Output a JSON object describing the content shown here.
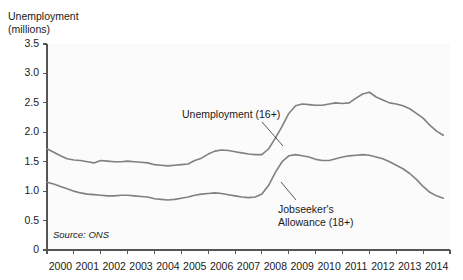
{
  "chart_data": {
    "type": "line",
    "title": "",
    "axis_title": "Unemployment\n(millions)",
    "xlabel": "",
    "ylabel": "Unemployment (millions)",
    "ylim": [
      0,
      3.5
    ],
    "xlim": [
      2000,
      2015
    ],
    "grid": false,
    "legend_position": "inline-annotations",
    "yticks": [
      "0",
      "0.5",
      "1.0",
      "1.5",
      "2.0",
      "2.5",
      "3.0",
      "3.5"
    ],
    "ytick_values": [
      0,
      0.5,
      1.0,
      1.5,
      2.0,
      2.5,
      3.0,
      3.5
    ],
    "xticks": [
      "2000",
      "2001",
      "2002",
      "2003",
      "2004",
      "2005",
      "2006",
      "2007",
      "2008",
      "2009",
      "2010",
      "2011",
      "2012",
      "2013",
      "2014"
    ],
    "xtick_values": [
      2000,
      2001,
      2002,
      2003,
      2004,
      2005,
      2006,
      2007,
      2008,
      2009,
      2010,
      2011,
      2012,
      2013,
      2014
    ],
    "source": "Source: ONS",
    "line_color": "#808080",
    "plot_background": "#fbfbfb",
    "axis_color": "#555555",
    "series": [
      {
        "name": "Unemployment (16+)",
        "label": "Unemployment (16+)",
        "x": [
          2000.0,
          2000.25,
          2000.5,
          2000.75,
          2001.0,
          2001.25,
          2001.5,
          2001.75,
          2002.0,
          2002.25,
          2002.5,
          2002.75,
          2003.0,
          2003.25,
          2003.5,
          2003.75,
          2004.0,
          2004.25,
          2004.5,
          2004.75,
          2005.0,
          2005.25,
          2005.5,
          2005.75,
          2006.0,
          2006.25,
          2006.5,
          2006.75,
          2007.0,
          2007.25,
          2007.5,
          2007.75,
          2008.0,
          2008.25,
          2008.5,
          2008.75,
          2009.0,
          2009.25,
          2009.5,
          2009.75,
          2010.0,
          2010.25,
          2010.5,
          2010.75,
          2011.0,
          2011.25,
          2011.5,
          2011.75,
          2012.0,
          2012.25,
          2012.5,
          2012.75,
          2013.0,
          2013.25,
          2013.5,
          2013.75,
          2014.0,
          2014.25,
          2014.5,
          2014.75
        ],
        "values": [
          1.72,
          1.66,
          1.6,
          1.55,
          1.53,
          1.52,
          1.5,
          1.48,
          1.52,
          1.51,
          1.5,
          1.5,
          1.51,
          1.5,
          1.49,
          1.48,
          1.45,
          1.44,
          1.43,
          1.44,
          1.45,
          1.46,
          1.52,
          1.56,
          1.63,
          1.68,
          1.7,
          1.69,
          1.67,
          1.65,
          1.63,
          1.62,
          1.62,
          1.72,
          1.9,
          2.1,
          2.32,
          2.45,
          2.48,
          2.47,
          2.46,
          2.46,
          2.48,
          2.5,
          2.49,
          2.5,
          2.58,
          2.65,
          2.68,
          2.6,
          2.55,
          2.5,
          2.48,
          2.45,
          2.4,
          2.32,
          2.24,
          2.12,
          2.02,
          1.95
        ],
        "start_value": 1.72,
        "peak_value": 2.68,
        "peak_year": 2012,
        "end_value": 1.95
      },
      {
        "name": "Jobseeker's Allowance (18+)",
        "label": "Jobseeker's\nAllowance (18+)",
        "x": [
          2000.0,
          2000.25,
          2000.5,
          2000.75,
          2001.0,
          2001.25,
          2001.5,
          2001.75,
          2002.0,
          2002.25,
          2002.5,
          2002.75,
          2003.0,
          2003.25,
          2003.5,
          2003.75,
          2004.0,
          2004.25,
          2004.5,
          2004.75,
          2005.0,
          2005.25,
          2005.5,
          2005.75,
          2006.0,
          2006.25,
          2006.5,
          2006.75,
          2007.0,
          2007.25,
          2007.5,
          2007.75,
          2008.0,
          2008.25,
          2008.5,
          2008.75,
          2009.0,
          2009.25,
          2009.5,
          2009.75,
          2010.0,
          2010.25,
          2010.5,
          2010.75,
          2011.0,
          2011.25,
          2011.5,
          2011.75,
          2012.0,
          2012.25,
          2012.5,
          2012.75,
          2013.0,
          2013.25,
          2013.5,
          2013.75,
          2014.0,
          2014.25,
          2014.5,
          2014.75
        ],
        "values": [
          1.15,
          1.12,
          1.08,
          1.04,
          1.0,
          0.97,
          0.95,
          0.94,
          0.93,
          0.92,
          0.92,
          0.93,
          0.93,
          0.92,
          0.91,
          0.9,
          0.87,
          0.86,
          0.85,
          0.86,
          0.88,
          0.9,
          0.93,
          0.95,
          0.96,
          0.97,
          0.96,
          0.94,
          0.92,
          0.9,
          0.89,
          0.9,
          0.95,
          1.1,
          1.32,
          1.5,
          1.6,
          1.62,
          1.6,
          1.58,
          1.54,
          1.52,
          1.52,
          1.55,
          1.58,
          1.6,
          1.61,
          1.62,
          1.61,
          1.58,
          1.55,
          1.5,
          1.44,
          1.38,
          1.3,
          1.2,
          1.08,
          0.98,
          0.92,
          0.88
        ],
        "start_value": 1.15,
        "peak_value": 1.62,
        "end_value": 0.88
      }
    ]
  }
}
